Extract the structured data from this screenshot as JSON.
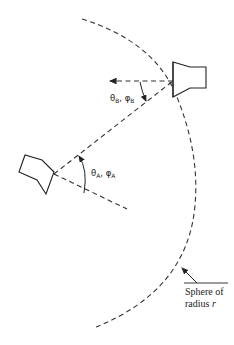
{
  "diagram": {
    "type": "antenna geometry",
    "antenna_a": {
      "label": "θA, φA",
      "theta": "θ",
      "theta_sub": "A",
      "phi": "φ",
      "phi_sub": "A"
    },
    "antenna_b": {
      "label": "θB, φB",
      "theta": "θ",
      "theta_sub": "B",
      "phi": "φ",
      "phi_sub": "B"
    },
    "sphere_label": {
      "line1": "Sphere of",
      "line2": "radius ",
      "var": "r"
    }
  }
}
